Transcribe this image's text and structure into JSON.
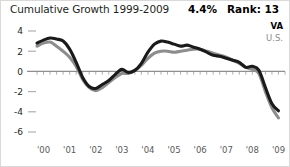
{
  "header": {
    "title": "Cumulative Growth 1999-2009",
    "growth_value": "4.4%",
    "rank_value": "Rank: 13"
  },
  "legend": {
    "items": [
      {
        "label": "VA",
        "color": "#1a1a1a"
      },
      {
        "label": "U.S.",
        "color": "#8d8d8d"
      }
    ]
  },
  "axis": {
    "y_ticks": [
      "4",
      "2",
      "0",
      "-2",
      "-4",
      "-6"
    ],
    "x_ticks": [
      "'00",
      "'01",
      "'02",
      "'03",
      "'04",
      "'05",
      "'06",
      "'07",
      "'08",
      "'09"
    ]
  },
  "chart_data": {
    "type": "line",
    "title": "Cumulative Growth 1999-2009",
    "xlabel": "",
    "ylabel": "",
    "ylim": [
      -6,
      4
    ],
    "xlim": [
      1999.75,
      2009.25
    ],
    "grid": false,
    "legend_position": "top-right",
    "annotations": [
      {
        "text": "4.4%",
        "role": "headline-growth"
      },
      {
        "text": "Rank: 13",
        "role": "state-rank"
      }
    ],
    "x": [
      1999.75,
      2000.0,
      2000.25,
      2000.5,
      2000.75,
      2001.0,
      2001.25,
      2001.5,
      2001.75,
      2002.0,
      2002.25,
      2002.5,
      2002.75,
      2003.0,
      2003.25,
      2003.5,
      2003.75,
      2004.0,
      2004.25,
      2004.5,
      2004.75,
      2005.0,
      2005.25,
      2005.5,
      2005.75,
      2006.0,
      2006.25,
      2006.5,
      2006.75,
      2007.0,
      2007.25,
      2007.5,
      2007.75,
      2008.0,
      2008.25,
      2008.5,
      2008.75,
      2009.0
    ],
    "series": [
      {
        "name": "VA",
        "color": "#1a1a1a",
        "values": [
          2.8,
          3.1,
          3.3,
          3.2,
          3.0,
          2.2,
          0.9,
          -0.6,
          -1.5,
          -1.7,
          -1.3,
          -0.9,
          -0.3,
          0.2,
          -0.1,
          0.1,
          0.8,
          1.9,
          2.7,
          3.0,
          2.9,
          2.7,
          2.5,
          2.6,
          2.4,
          2.2,
          1.9,
          1.6,
          1.5,
          1.3,
          1.1,
          0.9,
          0.4,
          0.5,
          0.1,
          -1.6,
          -3.2,
          -3.9
        ]
      },
      {
        "name": "U.S.",
        "color": "#8d8d8d",
        "values": [
          2.5,
          2.8,
          2.9,
          2.5,
          2.0,
          1.4,
          0.5,
          -0.8,
          -1.6,
          -1.9,
          -1.6,
          -1.1,
          -0.6,
          -0.2,
          -0.2,
          0.1,
          0.6,
          1.3,
          1.8,
          2.0,
          2.0,
          1.9,
          2.0,
          2.1,
          2.2,
          2.2,
          2.0,
          1.8,
          1.6,
          1.4,
          1.1,
          0.8,
          0.4,
          0.2,
          -0.2,
          -2.0,
          -3.6,
          -4.6
        ]
      }
    ]
  }
}
